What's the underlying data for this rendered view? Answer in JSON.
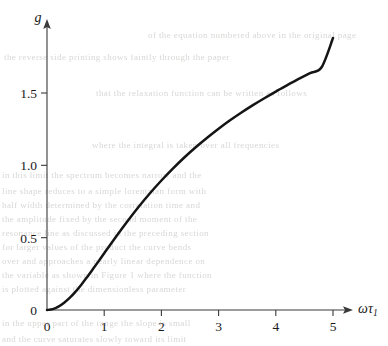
{
  "figure": {
    "background_color": "#ffffff",
    "curve_color": "#151515",
    "axis_color": "#3a3a3a"
  },
  "axes": {
    "y_axis_label": "g",
    "x_axis_label_symbol": "ωτ",
    "x_axis_label_subscript": "1",
    "x_ticklabels": [
      "0",
      "1",
      "2",
      "3",
      "4",
      "5"
    ],
    "y_ticklabels": [
      "0",
      "0.5",
      "1.0",
      "1.5"
    ]
  },
  "bleed_text": [
    {
      "text": "the  reverse  side  printing  shows  faintly  through  the  paper",
      "x": 4,
      "y": 52
    },
    {
      "text": "of  the  equation  numbered  above  in  the  original  page",
      "x": 148,
      "y": 30
    },
    {
      "text": "that  the  relaxation  function  can  be  written  as  follows",
      "x": 96,
      "y": 88
    },
    {
      "text": "where  the  integral  is  taken  over  all  frequencies",
      "x": 92,
      "y": 140
    },
    {
      "text": "in  this  limit  the  spectrum  becomes  narrow  and  the",
      "x": 2,
      "y": 170
    },
    {
      "text": "line  shape  reduces  to  a  simple  lorentzian  form  with",
      "x": 2,
      "y": 186
    },
    {
      "text": "half  width  determined  by  the  correlation  time  and",
      "x": 2,
      "y": 200
    },
    {
      "text": "the  amplitude  fixed  by  the  second  moment  of  the",
      "x": 2,
      "y": 214
    },
    {
      "text": "resonance  line  as  discussed  in  the  preceding  section",
      "x": 2,
      "y": 228
    },
    {
      "text": "for  larger  values  of  the  product  the  curve  bends",
      "x": 2,
      "y": 242
    },
    {
      "text": "over  and  approaches  a  nearly  linear  dependence  on",
      "x": 2,
      "y": 256
    },
    {
      "text": "the  variable  as  shown  in  Figure  1  where  the  function",
      "x": 2,
      "y": 270
    },
    {
      "text": "is  plotted  against  the  dimensionless  parameter",
      "x": 2,
      "y": 284
    },
    {
      "text": "in  the  upper  part  of  the  range  the  slope  is  small",
      "x": 2,
      "y": 318
    },
    {
      "text": "and  the  curve  saturates  slowly  toward  its  limit",
      "x": 2,
      "y": 334
    }
  ],
  "chart_data": {
    "type": "line",
    "title": "",
    "xlabel": "ωτ₁",
    "ylabel": "g",
    "xlim": [
      0,
      5.05
    ],
    "ylim": [
      0,
      1.95
    ],
    "xticks": [
      0,
      1,
      2,
      3,
      4,
      5
    ],
    "yticks": [
      0,
      0.5,
      1.0,
      1.5
    ],
    "grid": false,
    "legend": false,
    "series": [
      {
        "name": "g",
        "x": [
          0.0,
          0.1,
          0.2,
          0.3,
          0.4,
          0.5,
          0.6,
          0.7,
          0.8,
          0.9,
          1.0,
          1.2,
          1.4,
          1.6,
          1.8,
          2.0,
          2.2,
          2.4,
          2.6,
          2.8,
          3.0,
          3.2,
          3.4,
          3.6,
          3.8,
          4.0,
          4.2,
          4.4,
          4.6,
          4.8,
          5.0
        ],
        "y": [
          0.0,
          0.006,
          0.023,
          0.05,
          0.085,
          0.127,
          0.175,
          0.227,
          0.281,
          0.336,
          0.392,
          0.503,
          0.61,
          0.712,
          0.807,
          0.895,
          0.977,
          1.054,
          1.125,
          1.191,
          1.253,
          1.311,
          1.365,
          1.416,
          1.464,
          1.51,
          1.554,
          1.597,
          1.638,
          1.678,
          1.88
        ]
      }
    ]
  }
}
